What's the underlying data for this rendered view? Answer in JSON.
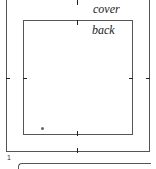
{
  "diagram": {
    "labels": {
      "cover": "cover",
      "back": "back"
    },
    "page_number": "1"
  }
}
